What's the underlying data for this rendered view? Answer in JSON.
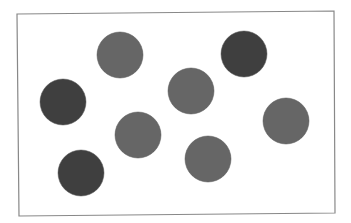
{
  "figure": {
    "background": "#ffffff",
    "frame": {
      "x1": 17,
      "y1": 14,
      "x2": 334,
      "y2": 11,
      "x3": 335,
      "y3": 213,
      "x4": 19,
      "y4": 216,
      "stroke": "#888888"
    },
    "colors": {
      "dark": "#3f3f3f",
      "medium": "#666666"
    },
    "circles": [
      {
        "id": "circle-1",
        "cx": 120,
        "cy": 55,
        "r": 23,
        "shade": "medium"
      },
      {
        "id": "circle-2",
        "cx": 244,
        "cy": 54,
        "r": 23,
        "shade": "dark"
      },
      {
        "id": "circle-3",
        "cx": 63,
        "cy": 102,
        "r": 23,
        "shade": "dark"
      },
      {
        "id": "circle-4",
        "cx": 191,
        "cy": 91,
        "r": 23,
        "shade": "medium"
      },
      {
        "id": "circle-5",
        "cx": 138,
        "cy": 135,
        "r": 23,
        "shade": "medium"
      },
      {
        "id": "circle-6",
        "cx": 286,
        "cy": 121,
        "r": 23,
        "shade": "medium"
      },
      {
        "id": "circle-7",
        "cx": 81,
        "cy": 173,
        "r": 23,
        "shade": "dark"
      },
      {
        "id": "circle-8",
        "cx": 208,
        "cy": 159,
        "r": 23,
        "shade": "medium"
      }
    ]
  }
}
